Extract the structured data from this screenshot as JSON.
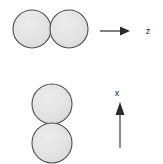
{
  "figure": {
    "title": "",
    "background_color": "#ffffff",
    "sphere_fill": "#e3e3e3",
    "sphere_stroke": "#4d4d4d",
    "arrow_color": "#3d3d3d",
    "label_color": "#1a1a1a"
  },
  "groups": [
    {
      "name": "horizontal-dimer",
      "orientation": "horizontal",
      "spheres": [
        {
          "id": "sphere-top-left",
          "cx": 32,
          "cy": 29,
          "r": 19
        },
        {
          "id": "sphere-top-right",
          "cx": 69,
          "cy": 29,
          "r": 19
        }
      ],
      "axis": {
        "id": "axis-z",
        "label": "z",
        "direction": "right",
        "label_x": 148,
        "label_y": 34,
        "line": {
          "x1": 100,
          "y1": 31,
          "x2": 128,
          "y2": 31
        },
        "head": "130,31 120,26.5 120,35.5"
      }
    },
    {
      "name": "vertical-dimer",
      "orientation": "vertical",
      "spheres": [
        {
          "id": "sphere-bottom-upper",
          "cx": 52,
          "cy": 104,
          "r": 20
        },
        {
          "id": "sphere-bottom-lower",
          "cx": 52,
          "cy": 143,
          "r": 20
        }
      ],
      "axis": {
        "id": "axis-x",
        "label": "x",
        "direction": "up",
        "label_x": 117,
        "label_y": 96,
        "line": {
          "x1": 120,
          "y1": 148,
          "x2": 120,
          "y2": 115
        },
        "head": "120,102 115.5,114 124.5,114"
      }
    }
  ]
}
